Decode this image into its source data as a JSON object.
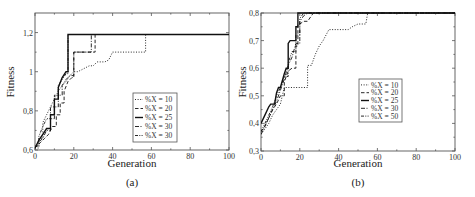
{
  "chart_data": [
    {
      "type": "line",
      "panel": "(a)",
      "title": "",
      "xlabel": "Generation",
      "ylabel": "Fitness",
      "caption": "(a)",
      "xlim": [
        0,
        100
      ],
      "ylim": [
        0.6,
        1.3
      ],
      "xticks": [
        "0",
        "20",
        "40",
        "60",
        "80",
        "100"
      ],
      "yticks": [
        "0,6",
        "0,8",
        "1",
        "1,2"
      ],
      "grid": false,
      "legend_position": "lower right (inside)",
      "series": [
        {
          "name": "%X = 10",
          "style": "dotted",
          "x": [
            0,
            2,
            4,
            6,
            8,
            10,
            12,
            14,
            16,
            18,
            20,
            22,
            24,
            26,
            28,
            30,
            32,
            34,
            36,
            38,
            40,
            45,
            50,
            56,
            57,
            100
          ],
          "y": [
            0.61,
            0.66,
            0.74,
            0.78,
            0.82,
            0.86,
            0.9,
            0.93,
            0.95,
            0.98,
            1.0,
            1.0,
            1.01,
            1.02,
            1.03,
            1.03,
            1.05,
            1.05,
            1.05,
            1.06,
            1.1,
            1.1,
            1.1,
            1.1,
            1.19,
            1.19
          ]
        },
        {
          "name": "%X = 20",
          "style": "dashed",
          "x": [
            0,
            3,
            5,
            7,
            9,
            11,
            13,
            15,
            17,
            19,
            20,
            22,
            24,
            26,
            28,
            30,
            31,
            100
          ],
          "y": [
            0.61,
            0.64,
            0.66,
            0.68,
            0.72,
            0.78,
            0.84,
            0.9,
            0.95,
            0.97,
            1.1,
            1.1,
            1.1,
            1.1,
            1.1,
            1.1,
            1.19,
            1.19
          ]
        },
        {
          "name": "%X = 25",
          "style": "solid",
          "x": [
            0,
            2,
            4,
            6,
            8,
            10,
            12,
            14,
            16,
            17,
            100
          ],
          "y": [
            0.61,
            0.65,
            0.68,
            0.71,
            0.78,
            0.86,
            0.92,
            0.97,
            1.0,
            1.19,
            1.19
          ]
        },
        {
          "name": "%X = 30",
          "style": "dash-dot",
          "x": [
            0,
            2,
            4,
            6,
            8,
            10,
            12,
            14,
            16,
            18,
            20,
            22,
            24,
            26,
            28,
            29,
            100
          ],
          "y": [
            0.61,
            0.64,
            0.66,
            0.7,
            0.76,
            0.82,
            0.88,
            0.93,
            0.96,
            0.98,
            1.1,
            1.1,
            1.1,
            1.1,
            1.1,
            1.19,
            1.19
          ]
        },
        {
          "name": "%X = 30",
          "style": "dash-dot-dot",
          "x": [
            0,
            2,
            4,
            6,
            8,
            10,
            12,
            14,
            16,
            17,
            100
          ],
          "y": [
            0.62,
            0.67,
            0.72,
            0.76,
            0.82,
            0.88,
            0.93,
            0.96,
            0.99,
            1.19,
            1.19
          ]
        }
      ]
    },
    {
      "type": "line",
      "panel": "(b)",
      "title": "",
      "xlabel": "Generation",
      "ylabel": "Fitness",
      "caption": "(b)",
      "xlim": [
        0,
        100
      ],
      "ylim": [
        0.3,
        0.8
      ],
      "xticks": [
        "0",
        "20",
        "40",
        "60",
        "80",
        "100"
      ],
      "yticks": [
        "0,3",
        "0,4",
        "0,5",
        "0,6",
        "0,7",
        "0,8"
      ],
      "grid": false,
      "legend_position": "center right (inside)",
      "series": [
        {
          "name": "%X = 10",
          "style": "dotted",
          "x": [
            0,
            2,
            4,
            6,
            8,
            10,
            11,
            12,
            20,
            23,
            24,
            26,
            28,
            30,
            32,
            35,
            40,
            45,
            47,
            50,
            54,
            55,
            100
          ],
          "y": [
            0.36,
            0.38,
            0.4,
            0.43,
            0.45,
            0.47,
            0.5,
            0.53,
            0.53,
            0.53,
            0.61,
            0.61,
            0.65,
            0.68,
            0.7,
            0.74,
            0.74,
            0.74,
            0.75,
            0.76,
            0.76,
            0.8,
            0.8
          ]
        },
        {
          "name": "%X = 20",
          "style": "dashed",
          "x": [
            0,
            2,
            4,
            6,
            8,
            10,
            12,
            14,
            16,
            18,
            19,
            20,
            22,
            24,
            26,
            27,
            100
          ],
          "y": [
            0.37,
            0.39,
            0.42,
            0.45,
            0.47,
            0.5,
            0.55,
            0.59,
            0.6,
            0.68,
            0.76,
            0.76,
            0.77,
            0.77,
            0.79,
            0.8,
            0.8
          ]
        },
        {
          "name": "%X = 25",
          "style": "solid",
          "x": [
            0,
            2,
            4,
            5,
            7,
            8,
            9,
            10,
            12,
            13,
            14,
            15,
            17,
            18,
            19,
            100
          ],
          "y": [
            0.4,
            0.43,
            0.46,
            0.47,
            0.47,
            0.51,
            0.53,
            0.53,
            0.58,
            0.6,
            0.69,
            0.7,
            0.7,
            0.75,
            0.8,
            0.8
          ]
        },
        {
          "name": "%X = 30",
          "style": "dash-dot",
          "x": [
            0,
            2,
            4,
            6,
            8,
            10,
            12,
            14,
            16,
            18,
            20,
            22,
            24,
            100
          ],
          "y": [
            0.36,
            0.39,
            0.42,
            0.45,
            0.48,
            0.52,
            0.56,
            0.61,
            0.64,
            0.69,
            0.77,
            0.79,
            0.8,
            0.8
          ]
        },
        {
          "name": "%X = 50",
          "style": "dash-dot-dot",
          "x": [
            0,
            2,
            4,
            6,
            8,
            10,
            12,
            14,
            16,
            18,
            20,
            22,
            100
          ],
          "y": [
            0.37,
            0.4,
            0.43,
            0.46,
            0.5,
            0.53,
            0.57,
            0.62,
            0.66,
            0.72,
            0.78,
            0.8,
            0.8
          ]
        }
      ]
    }
  ]
}
